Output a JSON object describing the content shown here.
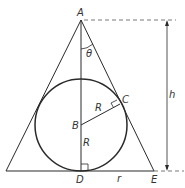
{
  "diagram": {
    "type": "geometry",
    "colors": {
      "line": "#2a2a2a",
      "text": "#333333",
      "background": "#ffffff"
    },
    "points": {
      "A": {
        "label": "A",
        "x": 81,
        "y": 20
      },
      "B": {
        "label": "B",
        "x": 81,
        "y": 125
      },
      "C": {
        "label": "C",
        "x": 120,
        "y": 104
      },
      "D": {
        "label": "D",
        "x": 81,
        "y": 171
      },
      "E": {
        "label": "E",
        "x": 154,
        "y": 171
      },
      "L": {
        "label": "",
        "x": 6,
        "y": 171
      }
    },
    "circle": {
      "center": "B",
      "radius": 46
    },
    "labels": {
      "A": "A",
      "B": "B",
      "C": "C",
      "D": "D",
      "E": "E",
      "theta": "θ",
      "R_upper": "R",
      "R_lower": "R",
      "r": "r",
      "h": "h"
    },
    "dimension": {
      "name": "h",
      "from": "A",
      "to": "base",
      "x": 167
    },
    "right_angles": [
      "C",
      "D"
    ]
  }
}
